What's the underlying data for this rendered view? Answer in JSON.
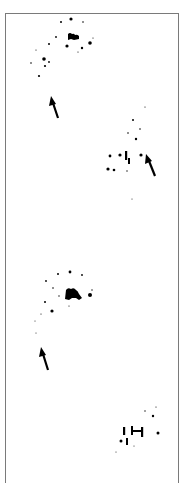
{
  "figure": {
    "background": "#ffffff",
    "ink": "#000000",
    "border_color": "#7a7a7a",
    "clusters": [
      {
        "name": "cluster-1",
        "cx": 68,
        "cy": 40
      },
      {
        "name": "cluster-2",
        "cx": 128,
        "cy": 160
      },
      {
        "name": "cluster-3",
        "cx": 72,
        "cy": 295
      },
      {
        "name": "cluster-4",
        "cx": 137,
        "cy": 435
      }
    ],
    "arrows": [
      {
        "name": "arrow-1",
        "tip": [
          51,
          96
        ],
        "tail": [
          58,
          118
        ]
      },
      {
        "name": "arrow-2",
        "tip": [
          146,
          154
        ],
        "tail": [
          155,
          176
        ]
      },
      {
        "name": "arrow-3",
        "tip": [
          41,
          347
        ],
        "tail": [
          48,
          370
        ]
      }
    ]
  }
}
